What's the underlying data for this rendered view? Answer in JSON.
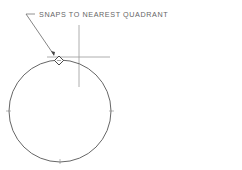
{
  "diagram": {
    "annotation": "SNAPS TO NEAREST QUADRANT",
    "colors": {
      "line": "#555555",
      "crosshair": "#999999",
      "text": "#666666",
      "background": "#ffffff"
    },
    "circle": {
      "cx": 60,
      "cy": 111,
      "r": 51
    },
    "crosshair": {
      "x": 79,
      "y": 57
    },
    "snap_marker": {
      "x": 59,
      "y": 60,
      "shape": "diamond"
    }
  }
}
